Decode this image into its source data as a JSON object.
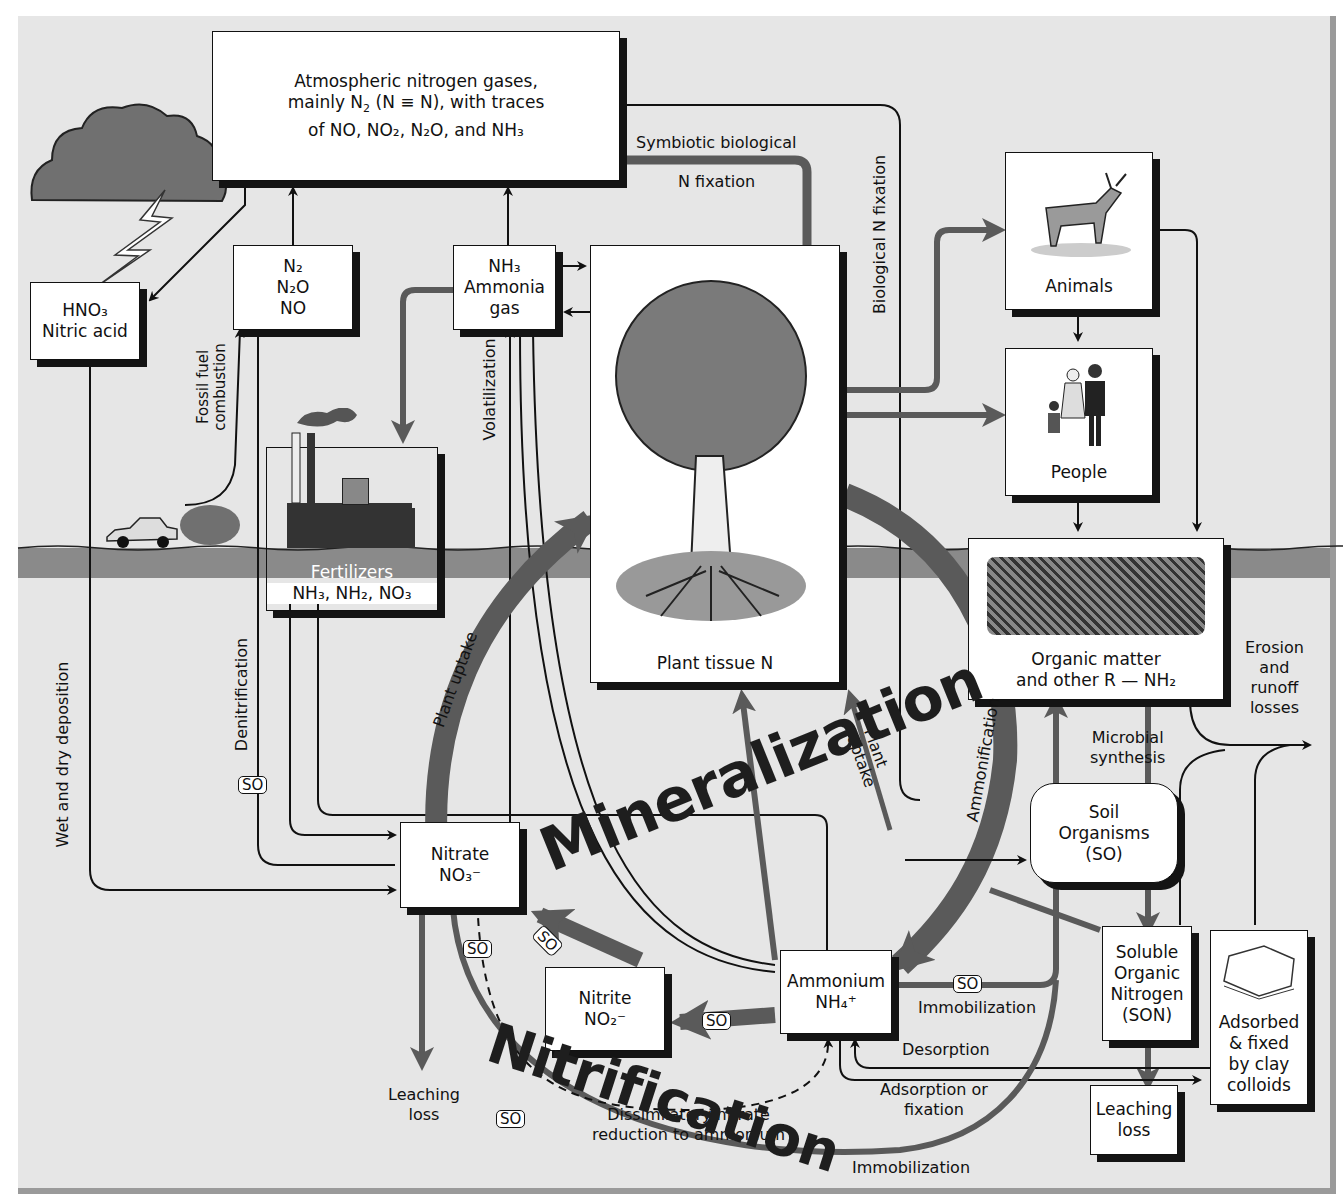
{
  "boxes": {
    "atmosphere": {
      "line1": "Atmospheric nitrogen gases,",
      "line2_pre": "mainly N",
      "line2_sub": "2",
      "line2_mid": " (N ",
      "line2_bond": "≡",
      "line2_post": " N), with traces",
      "line3": "of NO, NO₂, N₂O, and NH₃"
    },
    "hno3": {
      "formula": "HNO₃",
      "name": "Nitric acid"
    },
    "n_gases": {
      "l1": "N₂",
      "l2": "N₂O",
      "l3": "NO"
    },
    "nh3_gas": {
      "l1": "NH₃",
      "l2": "Ammonia",
      "l3": "gas"
    },
    "plant": {
      "label": "Plant tissue N"
    },
    "animals": {
      "label": "Animals"
    },
    "people": {
      "label": "People"
    },
    "fertilizers": {
      "title": "Fertilizers",
      "formula": "NH₃, NH₂, NO₃"
    },
    "organic": {
      "l1": "Organic matter",
      "l2": "and other R — NH₂"
    },
    "soil_org": {
      "l1": "Soil",
      "l2": "Organisms",
      "l3": "(SO)"
    },
    "nitrate": {
      "l1": "Nitrate",
      "l2": "NO₃⁻"
    },
    "nitrite": {
      "l1": "Nitrite",
      "l2": "NO₂⁻"
    },
    "ammonium": {
      "l1": "Ammonium",
      "l2": "NH₄⁺"
    },
    "son": {
      "l1": "Soluble",
      "l2": "Organic",
      "l3": "Nitrogen",
      "l4": "(SON)"
    },
    "clay": {
      "l1": "Adsorbed",
      "l2": "& fixed",
      "l3": "by clay",
      "l4": "colloids"
    },
    "leach_right": {
      "l1": "Leaching",
      "l2": "loss"
    }
  },
  "labels": {
    "symbiotic1": "Symbiotic biological",
    "symbiotic2": "N fixation",
    "bio_fix": "Biological N fixation",
    "fossil1": "Fossil fuel",
    "fossil2": "combustion",
    "volatilization": "Volatilization",
    "denitrification": "Denitrification",
    "wet_dry": "Wet and dry deposition",
    "plant_uptake": "Plant uptake",
    "plant_uptake2_a": "Plant",
    "plant_uptake2_b": "uptake",
    "ammonification": "Ammonification",
    "microbial1": "Microbial",
    "microbial2": "synthesis",
    "erosion1": "Erosion",
    "erosion2": "and",
    "erosion3": "runoff",
    "erosion4": "losses",
    "immobilization1": "Immobilization",
    "desorption": "Desorption",
    "adsorption1": "Adsorption or",
    "adsorption2": "fixation",
    "immobilization2": "Immobilization",
    "dnra1": "Dissimilatory nitrate",
    "dnra2": "reduction to ammonium",
    "leach_left1": "Leaching",
    "leach_left2": "loss",
    "mineralization": "Mineralization",
    "nitrification": "Nitrification",
    "so": "SO"
  },
  "colors": {
    "background": "#e6e6e6",
    "soil_band": "#8a8a8a",
    "thick_arrow": "#5a5a5a",
    "box_shadow": "#141414"
  }
}
